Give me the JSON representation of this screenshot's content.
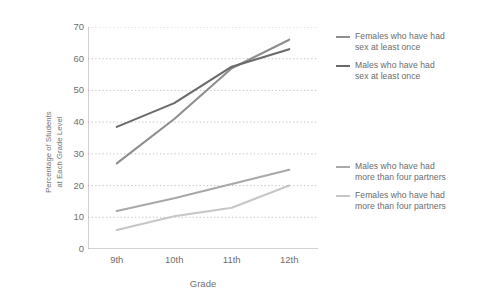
{
  "chart_data": {
    "type": "line",
    "title": "",
    "xlabel": "Grade",
    "ylabel": "Percentage of Students\nat Each Grade Level",
    "ylabel_line1": "Percentage of Students",
    "ylabel_line2": "at Each Grade Level",
    "categories": [
      "9th",
      "10th",
      "11th",
      "12th"
    ],
    "xtick_labels": [
      "9th",
      "10th",
      "11th",
      "12th"
    ],
    "ytick_labels": [
      "0",
      "10",
      "20",
      "30",
      "40",
      "50",
      "60",
      "70"
    ],
    "ytick_values": [
      0,
      10,
      20,
      30,
      40,
      50,
      60,
      70
    ],
    "ylim": [
      0,
      70
    ],
    "grid": "horizontal-dotted",
    "legend_position": "right",
    "series": [
      {
        "name": "Females who have had sex at least once",
        "name_line1": "Females who have had",
        "name_line2": "sex at least once",
        "color": "#8e8e8e",
        "values": [
          27,
          41,
          57,
          66
        ]
      },
      {
        "name": "Males who have had sex at least once",
        "name_line1": "Males who have had",
        "name_line2": "sex at least once",
        "color": "#6a6a6a",
        "values": [
          38.5,
          46,
          57.5,
          63
        ]
      },
      {
        "name": "Males who have had more than four partners",
        "name_line1": "Males who have had",
        "name_line2": "more than four partners",
        "color": "#a8a8a8",
        "values": [
          12,
          16,
          20.5,
          25
        ]
      },
      {
        "name": "Females who have had more than four partners",
        "name_line1": "Females who have had",
        "name_line2": "more than four partners",
        "color": "#c6c6c6",
        "values": [
          6,
          10.3,
          13,
          20
        ]
      }
    ]
  },
  "legend": {
    "groups": [
      {
        "items": [
          {
            "label": "Females who have had\nsex at least once",
            "color": "#8e8e8e"
          },
          {
            "label": "Males who have had\nsex at least once",
            "color": "#6a6a6a"
          }
        ]
      },
      {
        "items": [
          {
            "label": "Males who have had\nmore than four partners",
            "color": "#a8a8a8"
          },
          {
            "label": "Females who have had\nmore than four partners",
            "color": "#c6c6c6"
          }
        ]
      }
    ]
  },
  "axes": {
    "axis_color": "#9a9a9a",
    "grid_color": "#b9b9b9",
    "text_color": "#6f6f6f",
    "background": "#ffffff"
  }
}
